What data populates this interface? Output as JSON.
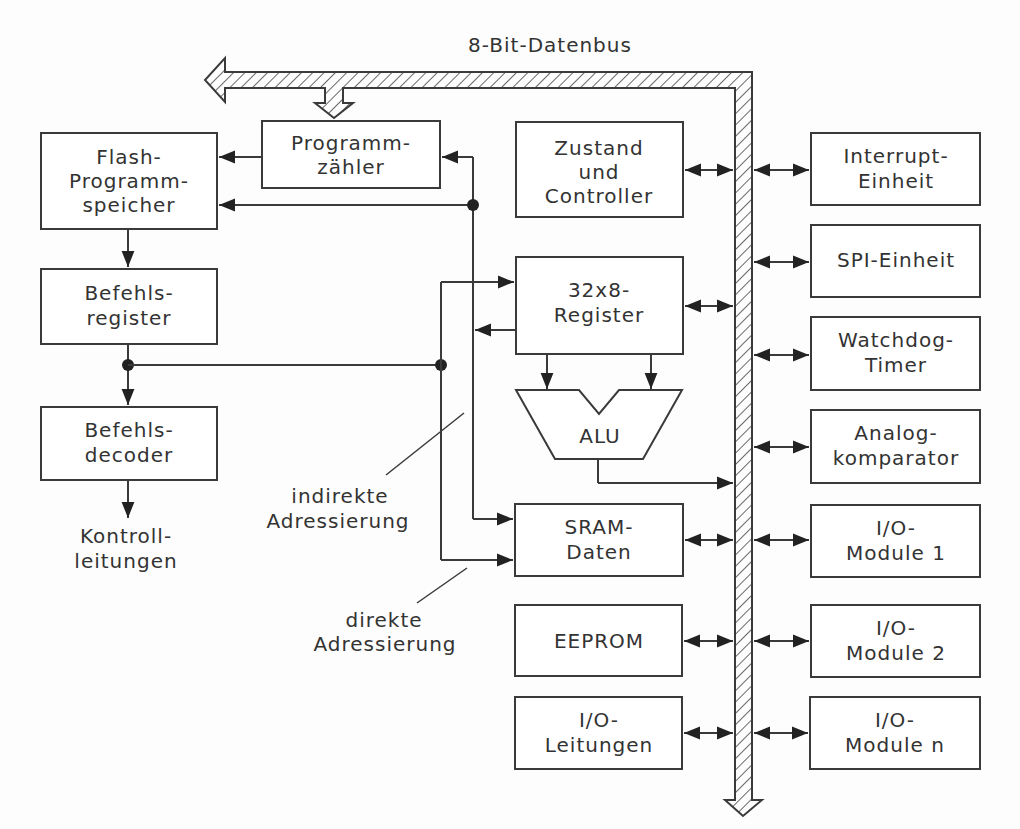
{
  "bus": {
    "label": "8-Bit-Datenbus"
  },
  "blocks": {
    "flash": [
      "Flash-",
      "Programm-",
      "speicher"
    ],
    "pc": [
      "Programm-",
      "zähler"
    ],
    "ir": [
      "Befehls-",
      "register"
    ],
    "dec": [
      "Befehls-",
      "decoder"
    ],
    "ctrl": [
      "Kontroll-",
      "leitungen"
    ],
    "zustand": [
      "Zustand",
      "und",
      "Controller"
    ],
    "reg": [
      "32x8-",
      "Register"
    ],
    "alu": "ALU",
    "sram": [
      "SRAM-",
      "Daten"
    ],
    "eeprom": "EEPROM",
    "iol": [
      "I/O-",
      "Leitungen"
    ],
    "int": [
      "Interrupt-",
      "Einheit"
    ],
    "spi": "SPI-Einheit",
    "wdt": [
      "Watchdog-",
      "Timer"
    ],
    "ana": [
      "Analog-",
      "komparator"
    ],
    "m1": [
      "I/O-",
      "Module 1"
    ],
    "m2": [
      "I/O-",
      "Module 2"
    ],
    "mn": [
      "I/O-",
      "Module n"
    ]
  },
  "annotations": {
    "indirect": [
      "indirekte",
      "Adressierung"
    ],
    "direct": [
      "direkte",
      "Adressierung"
    ]
  }
}
